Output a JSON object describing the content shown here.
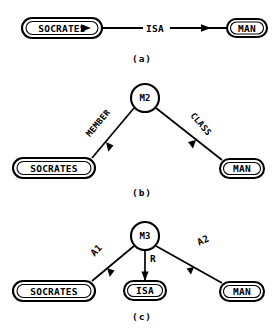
{
  "figure": {
    "background_color": "#ffffff",
    "ink_color": "#000000"
  },
  "panels": [
    {
      "id": "a",
      "caption": "(a)",
      "nodes": [
        {
          "id": "a-socrates",
          "label": "SOCRATES",
          "shape": "rounded-rect"
        },
        {
          "id": "a-man",
          "label": "MAN",
          "shape": "rounded-rect"
        }
      ],
      "edge_labels": [
        {
          "id": "a-isa",
          "label": "ISA"
        }
      ],
      "arrows": 2
    },
    {
      "id": "b",
      "caption": "(b)",
      "nodes": [
        {
          "id": "b-m2",
          "label": "M2",
          "shape": "circle"
        },
        {
          "id": "b-socrates",
          "label": "SOCRATES",
          "shape": "rounded-rect"
        },
        {
          "id": "b-man",
          "label": "MAN",
          "shape": "rounded-rect"
        }
      ],
      "edge_labels": [
        {
          "id": "b-member",
          "label": "MEMBER"
        },
        {
          "id": "b-class",
          "label": "CLASS"
        }
      ],
      "arrows": 2
    },
    {
      "id": "c",
      "caption": "(c)",
      "nodes": [
        {
          "id": "c-m3",
          "label": "M3",
          "shape": "circle"
        },
        {
          "id": "c-socrates",
          "label": "SOCRATES",
          "shape": "rounded-rect"
        },
        {
          "id": "c-isa",
          "label": "ISA",
          "shape": "rounded-rect"
        },
        {
          "id": "c-man",
          "label": "MAN",
          "shape": "rounded-rect"
        }
      ],
      "edge_labels": [
        {
          "id": "c-a1",
          "label": "A1"
        },
        {
          "id": "c-r",
          "label": "R"
        },
        {
          "id": "c-a2",
          "label": "A2"
        }
      ],
      "arrows": 3
    }
  ]
}
